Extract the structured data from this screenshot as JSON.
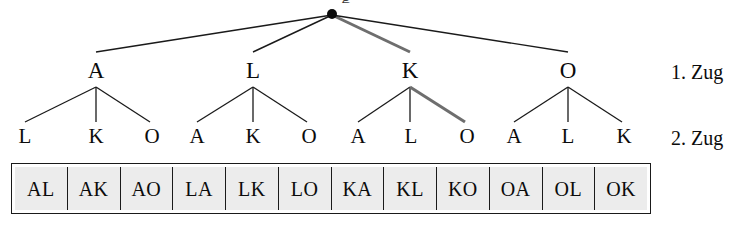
{
  "figure": {
    "title_fragment": "g",
    "root": {
      "label": "",
      "marker": "filled-dot"
    },
    "row_labels": [
      {
        "id": "move-1",
        "text": "1. Zug"
      },
      {
        "id": "move-2",
        "text": "2. Zug"
      }
    ]
  },
  "tree": {
    "level1": [
      {
        "label": "A"
      },
      {
        "label": "L"
      },
      {
        "label": "K"
      },
      {
        "label": "O"
      }
    ],
    "level2": [
      {
        "label": "L"
      },
      {
        "label": "K"
      },
      {
        "label": "O"
      },
      {
        "label": "A"
      },
      {
        "label": "K"
      },
      {
        "label": "O"
      },
      {
        "label": "A"
      },
      {
        "label": "L"
      },
      {
        "label": "O"
      },
      {
        "label": "A"
      },
      {
        "label": "L"
      },
      {
        "label": "K"
      }
    ]
  },
  "leaves": [
    {
      "label": "AL"
    },
    {
      "label": "AK"
    },
    {
      "label": "AO"
    },
    {
      "label": "LA"
    },
    {
      "label": "LK"
    },
    {
      "label": "LO"
    },
    {
      "label": "KA"
    },
    {
      "label": "KL"
    },
    {
      "label": "KO"
    },
    {
      "label": "OA"
    },
    {
      "label": "OL"
    },
    {
      "label": "OK"
    }
  ],
  "colors": {
    "line": "#1a1a1a",
    "highlight_line": "#6e6e6e",
    "text": "#0b0b0b",
    "cell_fill": "#ececec",
    "cell_border": "#1a1a1a",
    "background": "#ffffff"
  },
  "highlight_path": {
    "description": "root to K to O",
    "nodes": [
      "K",
      "O"
    ],
    "leaf": "KO"
  }
}
